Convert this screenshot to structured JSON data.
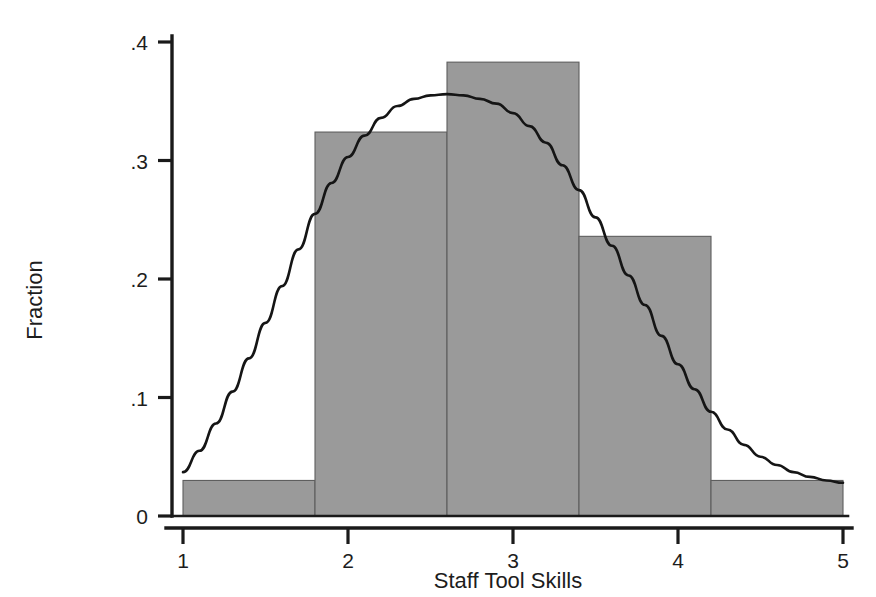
{
  "chart_data": {
    "type": "bar",
    "title": "",
    "subtitle": "",
    "xlabel": "Staff Tool Skills",
    "ylabel": "Fraction",
    "xlim": [
      1,
      5
    ],
    "ylim": [
      0,
      0.4
    ],
    "grid": false,
    "legend": null,
    "x_ticks": [
      1,
      2,
      3,
      4,
      5
    ],
    "x_tick_labels": [
      "1",
      "2",
      "3",
      "4",
      "5"
    ],
    "y_ticks": [
      0,
      0.1,
      0.2,
      0.3,
      0.4
    ],
    "y_tick_labels": [
      "0",
      ".1",
      ".2",
      ".3",
      ".4"
    ],
    "bin_edges": [
      1.0,
      1.8,
      2.6,
      3.4,
      4.2,
      5.0
    ],
    "categories": [
      "1.0-1.8",
      "1.8-2.6",
      "2.6-3.4",
      "3.4-4.2",
      "4.2-5.0"
    ],
    "values": [
      0.03,
      0.324,
      0.383,
      0.236,
      0.03
    ],
    "bar_fill_color": "#9a9a9a",
    "bar_edge_color": "#5e5e5e",
    "series": [
      {
        "name": "Fraction",
        "type": "bar",
        "values": [
          0.03,
          0.324,
          0.383,
          0.236,
          0.03
        ]
      },
      {
        "name": "Normal density overlay",
        "type": "line",
        "color": "#151515",
        "mean": 2.9,
        "peak_value": 0.355,
        "points": [
          [
            1.0,
            0.037
          ],
          [
            1.1,
            0.055
          ],
          [
            1.2,
            0.078
          ],
          [
            1.3,
            0.105
          ],
          [
            1.4,
            0.133
          ],
          [
            1.5,
            0.163
          ],
          [
            1.6,
            0.194
          ],
          [
            1.7,
            0.225
          ],
          [
            1.8,
            0.255
          ],
          [
            1.9,
            0.281
          ],
          [
            2.0,
            0.303
          ],
          [
            2.1,
            0.321
          ],
          [
            2.2,
            0.336
          ],
          [
            2.3,
            0.346
          ],
          [
            2.4,
            0.352
          ],
          [
            2.5,
            0.355
          ],
          [
            2.6,
            0.356
          ],
          [
            2.7,
            0.355
          ],
          [
            2.8,
            0.352
          ],
          [
            2.9,
            0.348
          ],
          [
            3.0,
            0.34
          ],
          [
            3.1,
            0.329
          ],
          [
            3.2,
            0.315
          ],
          [
            3.3,
            0.296
          ],
          [
            3.4,
            0.275
          ],
          [
            3.5,
            0.252
          ],
          [
            3.6,
            0.228
          ],
          [
            3.7,
            0.203
          ],
          [
            3.8,
            0.178
          ],
          [
            3.9,
            0.152
          ],
          [
            4.0,
            0.128
          ],
          [
            4.1,
            0.107
          ],
          [
            4.2,
            0.088
          ],
          [
            4.3,
            0.073
          ],
          [
            4.4,
            0.06
          ],
          [
            4.5,
            0.05
          ],
          [
            4.6,
            0.043
          ],
          [
            4.7,
            0.037
          ],
          [
            4.8,
            0.033
          ],
          [
            4.9,
            0.03
          ],
          [
            5.0,
            0.028
          ]
        ]
      }
    ]
  }
}
